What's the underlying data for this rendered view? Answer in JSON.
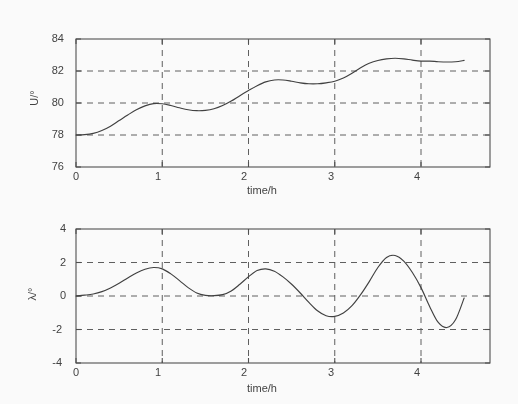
{
  "figure": {
    "background": "#ffffff",
    "line_color": "#3a3a3a",
    "grid_color": "#5a5a5a",
    "axis_color": "#4a4a4a"
  },
  "chart_data": [
    {
      "id": "top",
      "type": "line",
      "title": "",
      "xlabel": "time/h",
      "ylabel": "U/°",
      "xlim": [
        0,
        4.8
      ],
      "ylim": [
        76,
        84
      ],
      "xticks": [
        0,
        1,
        2,
        3,
        4
      ],
      "xticklabels": [
        "0",
        "1",
        "2",
        "3",
        "4"
      ],
      "yticks": [
        76,
        78,
        80,
        82,
        84
      ],
      "yticklabels": [
        "76",
        "78",
        "80",
        "82",
        "84"
      ],
      "grid": true,
      "grid_style": "dashed",
      "legend": null,
      "series": [
        {
          "name": "U",
          "x": [
            0.0,
            0.1,
            0.2,
            0.3,
            0.4,
            0.5,
            0.6,
            0.7,
            0.8,
            0.9,
            1.0,
            1.1,
            1.2,
            1.3,
            1.4,
            1.5,
            1.6,
            1.7,
            1.8,
            1.9,
            2.0,
            2.1,
            2.2,
            2.3,
            2.4,
            2.5,
            2.6,
            2.7,
            2.8,
            2.9,
            3.0,
            3.1,
            3.2,
            3.3,
            3.4,
            3.5,
            3.6,
            3.7,
            3.8,
            3.9,
            4.0,
            4.1,
            4.2,
            4.3,
            4.4,
            4.5
          ],
          "y": [
            78.0,
            78.02,
            78.1,
            78.28,
            78.55,
            78.9,
            79.25,
            79.58,
            79.82,
            79.96,
            79.95,
            79.84,
            79.7,
            79.58,
            79.52,
            79.54,
            79.64,
            79.84,
            80.12,
            80.46,
            80.78,
            81.08,
            81.32,
            81.44,
            81.44,
            81.36,
            81.26,
            81.2,
            81.2,
            81.26,
            81.36,
            81.56,
            81.86,
            82.2,
            82.48,
            82.66,
            82.76,
            82.8,
            82.76,
            82.68,
            82.62,
            82.62,
            82.58,
            82.56,
            82.58,
            82.66
          ]
        }
      ]
    },
    {
      "id": "bottom",
      "type": "line",
      "title": "",
      "xlabel": "time/h",
      "ylabel": "λ/°",
      "xlim": [
        0,
        4.8
      ],
      "ylim": [
        -4,
        4
      ],
      "xticks": [
        0,
        1,
        2,
        3,
        4
      ],
      "xticklabels": [
        "0",
        "1",
        "2",
        "3",
        "4"
      ],
      "yticks": [
        -4,
        -2,
        0,
        2,
        4
      ],
      "yticklabels": [
        "-4",
        "-2",
        "0",
        "2",
        "4"
      ],
      "grid": true,
      "grid_style": "dashed",
      "legend": null,
      "series": [
        {
          "name": "lambda",
          "x": [
            0.0,
            0.1,
            0.2,
            0.3,
            0.4,
            0.5,
            0.6,
            0.7,
            0.8,
            0.9,
            1.0,
            1.1,
            1.2,
            1.3,
            1.4,
            1.5,
            1.6,
            1.7,
            1.8,
            1.9,
            2.0,
            2.1,
            2.2,
            2.3,
            2.4,
            2.5,
            2.6,
            2.7,
            2.8,
            2.9,
            3.0,
            3.1,
            3.2,
            3.3,
            3.4,
            3.5,
            3.6,
            3.7,
            3.8,
            3.9,
            4.0,
            4.1,
            4.2,
            4.3,
            4.4,
            4.5
          ],
          "y": [
            0.0,
            0.05,
            0.12,
            0.26,
            0.48,
            0.76,
            1.08,
            1.38,
            1.6,
            1.7,
            1.62,
            1.32,
            0.92,
            0.5,
            0.18,
            0.04,
            0.02,
            0.08,
            0.3,
            0.7,
            1.15,
            1.52,
            1.62,
            1.48,
            1.14,
            0.7,
            0.18,
            -0.38,
            -0.88,
            -1.18,
            -1.22,
            -1.02,
            -0.58,
            0.08,
            0.86,
            1.7,
            2.3,
            2.42,
            2.08,
            1.4,
            0.5,
            -0.62,
            -1.58,
            -1.88,
            -1.42,
            -0.12
          ]
        }
      ]
    }
  ]
}
